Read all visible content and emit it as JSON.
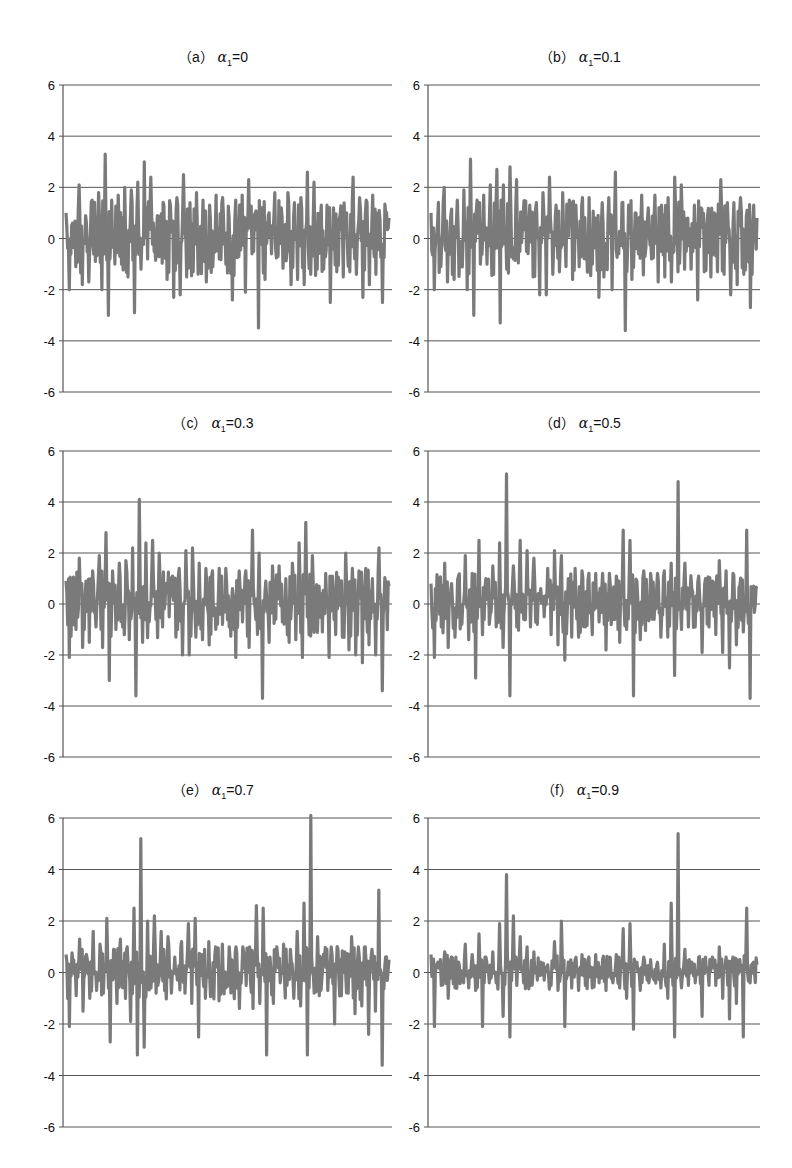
{
  "figure": {
    "panels": [
      {
        "id": "a",
        "prefix": "（a）",
        "alpha_symbol": "α",
        "subscript": "1",
        "value": "=0"
      },
      {
        "id": "b",
        "prefix": "（b）",
        "alpha_symbol": "α",
        "subscript": "1",
        "value": "=0.1"
      },
      {
        "id": "c",
        "prefix": "（c）",
        "alpha_symbol": "α",
        "subscript": "1",
        "value": "=0.3"
      },
      {
        "id": "d",
        "prefix": "（d）",
        "alpha_symbol": "α",
        "subscript": "1",
        "value": "=0.5"
      },
      {
        "id": "e",
        "prefix": "（e）",
        "alpha_symbol": "α",
        "subscript": "1",
        "value": "=0.7"
      },
      {
        "id": "f",
        "prefix": "（f）",
        "alpha_symbol": "α",
        "subscript": "1",
        "value": "=0.9"
      }
    ],
    "y_ticks": [
      "6",
      "4",
      "2",
      "0",
      "-2",
      "-4",
      "-6"
    ],
    "colors": {
      "series": "#7a7a7a",
      "grid": "#555555",
      "axis": "#555555"
    }
  },
  "chart_data": [
    {
      "type": "line",
      "title": "(a) α1=0",
      "xlabel": "",
      "ylabel": "",
      "ylim": [
        -6,
        6
      ],
      "yticks": [
        -6,
        -4,
        -2,
        0,
        2,
        4,
        6
      ],
      "grid": "horizontal",
      "legend": "none",
      "series": [
        {
          "name": "α1=0",
          "values": [
            1.0,
            -2.0,
            0.6,
            -1.1,
            2.1,
            -1.8,
            0.9,
            -1.7,
            1.5,
            -0.9,
            1.8,
            -2.0,
            3.3,
            -3.0,
            1.5,
            -1.0,
            1.7,
            -1.0,
            2.0,
            -1.5,
            1.9,
            -2.9,
            2.2,
            -1.2,
            3.0,
            -0.8,
            2.4,
            -0.5,
            0.9,
            -0.5,
            1.3,
            -1.6,
            1.3,
            -2.3,
            1.6,
            -2.2,
            2.5,
            -1.5,
            1.4,
            -1.3,
            1.8,
            -1.1,
            1.5,
            -1.7,
            1.3,
            -1.1,
            1.7,
            -0.8,
            1.6,
            -1.0,
            0.8,
            -2.4,
            1.5,
            -0.7,
            1.7,
            -2.1,
            2.3,
            -0.6,
            1.0,
            -3.5,
            1.2,
            -1.6,
            0.9,
            -0.6,
            1.8,
            -0.7,
            1.2,
            -0.8,
            1.8,
            -1.8,
            1.4,
            -1.6,
            1.6,
            -1.8,
            2.6,
            -1.4,
            2.2,
            -1.2,
            0.8,
            -1.2,
            1.3,
            -2.5,
            1.2,
            -1.3,
            0.9,
            -1.5,
            1.0,
            -1.3,
            2.4,
            -1.4,
            1.6,
            -2.3,
            1.5,
            -1.8,
            1.7,
            -1.4,
            1.1,
            -2.5,
            1.0,
            0.8
          ]
        }
      ]
    },
    {
      "type": "line",
      "title": "(b) α1=0.1",
      "xlabel": "",
      "ylabel": "",
      "ylim": [
        -6,
        6
      ],
      "yticks": [
        -6,
        -4,
        -2,
        0,
        2,
        4,
        6
      ],
      "grid": "horizontal",
      "legend": "none",
      "series": [
        {
          "name": "α1=0.1",
          "values": [
            1.0,
            -2.0,
            0.6,
            -1.1,
            2.0,
            -1.7,
            0.9,
            -1.6,
            1.5,
            -0.9,
            1.9,
            -2.0,
            3.1,
            -3.0,
            1.5,
            -1.0,
            1.7,
            -1.0,
            2.1,
            -1.4,
            2.7,
            -3.3,
            2.1,
            -1.2,
            2.8,
            -0.8,
            2.3,
            -0.5,
            0.9,
            -0.5,
            1.3,
            -1.5,
            1.4,
            -2.2,
            1.8,
            -2.2,
            2.4,
            -1.4,
            1.3,
            -1.3,
            1.8,
            -1.1,
            1.5,
            -1.6,
            1.3,
            -1.1,
            1.6,
            -0.8,
            1.6,
            -1.0,
            0.8,
            -2.3,
            1.4,
            -0.7,
            1.6,
            -2.0,
            2.6,
            -0.6,
            1.4,
            -3.6,
            1.3,
            -1.6,
            1.0,
            -0.6,
            1.7,
            -0.7,
            1.2,
            -0.8,
            1.7,
            -1.7,
            1.3,
            -1.5,
            1.6,
            -1.7,
            2.4,
            -1.3,
            2.1,
            -1.2,
            0.8,
            -1.2,
            1.3,
            -2.4,
            1.2,
            -1.3,
            0.9,
            -1.5,
            1.0,
            -1.3,
            2.3,
            -1.4,
            1.4,
            -2.2,
            1.4,
            -1.8,
            1.6,
            -1.4,
            1.1,
            -2.7,
            1.3,
            0.8
          ]
        }
      ]
    },
    {
      "type": "line",
      "title": "(c) α1=0.3",
      "xlabel": "",
      "ylabel": "",
      "ylim": [
        -6,
        6
      ],
      "yticks": [
        -6,
        -4,
        -2,
        0,
        2,
        4,
        6
      ],
      "grid": "horizontal",
      "legend": "none",
      "series": [
        {
          "name": "α1=0.3",
          "values": [
            0.9,
            -2.1,
            0.6,
            -1.0,
            1.8,
            -1.7,
            0.9,
            -1.5,
            1.3,
            -0.9,
            1.9,
            -1.7,
            2.8,
            -3.0,
            1.3,
            -1.0,
            1.6,
            -0.9,
            1.7,
            -1.4,
            2.2,
            -3.6,
            4.1,
            -1.5,
            2.4,
            -0.7,
            2.5,
            -0.6,
            2.0,
            -0.9,
            0.8,
            -0.5,
            1.1,
            -1.3,
            1.4,
            -2.0,
            2.1,
            -2.0,
            2.2,
            -1.3,
            1.6,
            -1.4,
            1.4,
            -1.6,
            1.3,
            -1.0,
            1.4,
            -0.8,
            1.4,
            -0.9,
            0.6,
            -2.1,
            1.3,
            -0.7,
            1.3,
            -1.7,
            2.9,
            -0.6,
            2.0,
            -3.7,
            0.9,
            -1.5,
            1.5,
            -0.6,
            1.5,
            -0.7,
            1.0,
            -1.5,
            1.6,
            -1.4,
            2.4,
            -2.1,
            3.2,
            -1.2,
            1.9,
            -1.0,
            0.7,
            -1.1,
            1.2,
            -2.1,
            1.1,
            -1.2,
            0.9,
            -1.3,
            2.0,
            -1.8,
            1.4,
            -2.0,
            1.3,
            -2.3,
            1.4,
            -1.6,
            1.0,
            -2.0,
            2.2,
            -3.4,
            0.8,
            0.7
          ]
        }
      ]
    },
    {
      "type": "line",
      "title": "(d) α1=0.5",
      "xlabel": "",
      "ylabel": "",
      "ylim": [
        -6,
        6
      ],
      "yticks": [
        -6,
        -4,
        -2,
        0,
        2,
        4,
        6
      ],
      "grid": "horizontal",
      "legend": "none",
      "series": [
        {
          "name": "α1=0.5",
          "values": [
            0.8,
            -2.1,
            0.6,
            -0.9,
            1.6,
            -1.7,
            0.8,
            -1.3,
            1.1,
            -0.8,
            1.9,
            -1.4,
            1.2,
            -2.9,
            2.5,
            -1.2,
            1.0,
            -0.8,
            1.5,
            -0.9,
            2.4,
            -1.7,
            5.1,
            -3.6,
            1.5,
            -0.9,
            2.5,
            -0.6,
            2.1,
            -0.9,
            1.8,
            -0.8,
            0.6,
            -0.5,
            1.4,
            -1.2,
            2.1,
            -1.6,
            1.9,
            -2.2,
            1.0,
            -1.3,
            1.4,
            -1.3,
            1.3,
            -0.9,
            1.2,
            -1.2,
            1.2,
            -0.7,
            1.2,
            -1.8,
            1.2,
            -0.6,
            1.1,
            -1.5,
            2.9,
            -1.0,
            2.5,
            -3.6,
            0.9,
            -1.4,
            1.3,
            -0.6,
            1.2,
            -0.6,
            1.2,
            -1.3,
            1.3,
            -1.3,
            1.6,
            -2.8,
            4.8,
            -1.0,
            1.6,
            -0.9,
            0.6,
            -0.9,
            1.1,
            -1.9,
            1.0,
            -0.9,
            0.9,
            -1.2,
            1.7,
            -1.9,
            1.3,
            -2.5,
            1.2,
            -1.6,
            0.7,
            -1.1,
            2.9,
            -3.7,
            0.7,
            0.6
          ]
        }
      ]
    },
    {
      "type": "line",
      "title": "(e) α1=0.7",
      "xlabel": "",
      "ylabel": "",
      "ylim": [
        -6,
        6
      ],
      "yticks": [
        -6,
        -4,
        -2,
        0,
        2,
        4,
        6
      ],
      "grid": "horizontal",
      "legend": "none",
      "series": [
        {
          "name": "α1=0.7",
          "values": [
            0.7,
            -2.1,
            0.5,
            -0.9,
            1.3,
            -1.5,
            0.7,
            -1.0,
            1.6,
            -0.7,
            1.1,
            -0.8,
            2.1,
            -2.7,
            0.9,
            -1.2,
            1.3,
            -0.6,
            1.0,
            -1.9,
            2.5,
            -3.2,
            5.2,
            -2.9,
            2.0,
            -0.6,
            2.2,
            -0.5,
            1.6,
            -0.7,
            1.4,
            -0.8,
            0.6,
            -0.3,
            1.2,
            -0.8,
            1.9,
            -1.2,
            2.1,
            -2.5,
            0.7,
            -1.0,
            1.2,
            -0.9,
            1.0,
            -1.1,
            1.1,
            -0.6,
            1.0,
            -0.6,
            1.0,
            -1.4,
            1.0,
            -0.5,
            1.0,
            -1.4,
            2.6,
            -1.2,
            2.5,
            -3.2,
            0.6,
            -1.2,
            1.0,
            -0.4,
            1.1,
            -0.5,
            0.9,
            -1.0,
            1.6,
            -1.3,
            2.7,
            -3.2,
            6.1,
            -0.8,
            1.4,
            -0.7,
            0.5,
            -0.7,
            1.0,
            -2.0,
            0.9,
            -0.9,
            0.8,
            -0.8,
            1.4,
            -1.6,
            1.0,
            -1.3,
            1.0,
            -2.4,
            0.9,
            -1.5,
            3.2,
            -3.6,
            0.6,
            0.5
          ]
        }
      ]
    },
    {
      "type": "line",
      "title": "(f) α1=0.9",
      "xlabel": "",
      "ylabel": "",
      "ylim": [
        -6,
        6
      ],
      "yticks": [
        -6,
        -4,
        -2,
        0,
        2,
        4,
        6
      ],
      "grid": "horizontal",
      "legend": "none",
      "series": [
        {
          "name": "α1=0.9",
          "values": [
            0.7,
            -2.1,
            0.4,
            -0.5,
            0.8,
            -1.0,
            0.6,
            -0.6,
            0.4,
            -0.3,
            1.1,
            -0.6,
            0.7,
            -0.7,
            1.5,
            -2.1,
            0.6,
            -0.4,
            0.8,
            -0.4,
            1.9,
            -1.7,
            3.8,
            -2.5,
            2.2,
            -0.5,
            1.4,
            -0.4,
            1.0,
            -0.5,
            0.8,
            -0.3,
            0.4,
            -0.3,
            0.3,
            -0.5,
            1.2,
            -0.7,
            2.0,
            -2.1,
            0.4,
            -0.6,
            0.5,
            -0.7,
            0.7,
            -0.5,
            0.6,
            -0.6,
            0.7,
            -0.4,
            0.5,
            -0.7,
            0.6,
            -0.4,
            0.7,
            -0.6,
            1.7,
            -1.0,
            1.9,
            -2.2,
            0.4,
            -0.7,
            0.6,
            -0.3,
            0.5,
            -0.3,
            0.4,
            -0.6,
            1.1,
            -1.0,
            2.7,
            -2.5,
            5.4,
            -0.6,
            0.9,
            -0.5,
            0.4,
            -0.4,
            0.6,
            -1.7,
            0.6,
            -0.5,
            0.6,
            -0.5,
            1.0,
            -1.0,
            0.6,
            -1.8,
            0.6,
            -1.2,
            0.5,
            -2.5,
            2.5,
            -0.4,
            0.4,
            0.3
          ]
        }
      ]
    }
  ]
}
